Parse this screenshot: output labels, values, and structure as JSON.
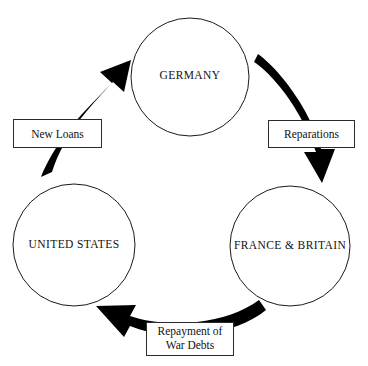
{
  "diagram": {
    "background_color": "#ffffff",
    "line_color": "#1a1a1a",
    "arrow_color": "#000000",
    "nodes": [
      {
        "id": "germany",
        "label": "GERMANY",
        "shape": "circle",
        "position": "top-center"
      },
      {
        "id": "united-states",
        "label": "UNITED STATES",
        "shape": "circle",
        "position": "bottom-left"
      },
      {
        "id": "france-britain",
        "label": "FRANCE & BRITAIN",
        "shape": "circle",
        "position": "bottom-right"
      }
    ],
    "edges": [
      {
        "id": "reparations",
        "label_lines": [
          "Reparations"
        ],
        "from": "germany",
        "to": "france-britain",
        "direction": "down-right",
        "style": "thick-curved-black-arrow"
      },
      {
        "id": "repayment-of-war-debts",
        "label_lines": [
          "Repayment of",
          "War Debts"
        ],
        "from": "france-britain",
        "to": "united-states",
        "direction": "right-to-left",
        "style": "thick-curved-black-arrow"
      },
      {
        "id": "new-loans",
        "label_lines": [
          "New Loans"
        ],
        "from": "united-states",
        "to": "germany",
        "direction": "up-right",
        "style": "thick-curved-black-arrow"
      }
    ]
  }
}
